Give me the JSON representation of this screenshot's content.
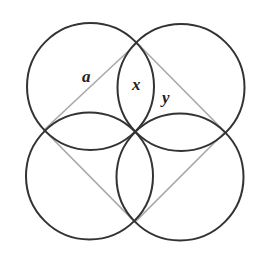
{
  "diagram": {
    "square": {
      "vertices": [
        [
          137,
          43
        ],
        [
          225,
          132
        ],
        [
          135,
          222
        ],
        [
          44,
          130
        ]
      ],
      "stroke": "#a9a9a9",
      "side_label": "a"
    },
    "circles": [
      {
        "name": "top-left",
        "cx": 90.5,
        "cy": 86.5,
        "r": 63.5
      },
      {
        "name": "top-right",
        "cx": 181,
        "cy": 87.5,
        "r": 63.5
      },
      {
        "name": "bottom-right",
        "cx": 180,
        "cy": 177,
        "r": 63.5
      },
      {
        "name": "bottom-left",
        "cx": 89.5,
        "cy": 176,
        "r": 63.5
      }
    ],
    "circle_stroke": "#333333",
    "labels": {
      "a": "a",
      "x": "x",
      "y": "y"
    }
  }
}
